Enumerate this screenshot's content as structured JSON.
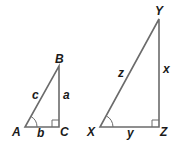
{
  "diagram": {
    "type": "similar right triangles",
    "stroke_color": "#6b6b6b",
    "label_color": "#1a1a1a",
    "triangles": [
      {
        "name": "ABC",
        "vertices": {
          "A": "A",
          "B": "B",
          "C": "C"
        },
        "sides": {
          "a": "a",
          "b": "b",
          "c": "c"
        },
        "right_angle_at": "C",
        "marked_angle_at": "A"
      },
      {
        "name": "XYZ",
        "vertices": {
          "X": "X",
          "Y": "Y",
          "Z": "Z"
        },
        "sides": {
          "x": "x",
          "y": "y",
          "z": "z"
        },
        "right_angle_at": "Z",
        "marked_angle_at": "X"
      }
    ]
  }
}
